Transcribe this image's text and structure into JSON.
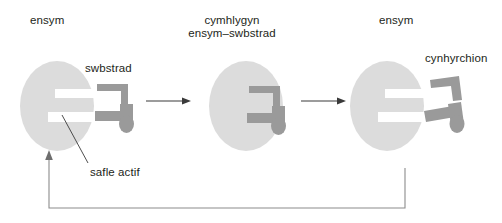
{
  "diagram": {
    "title_language": "Welsh",
    "topic": "enzyme-substrate lock and key mechanism",
    "colors": {
      "enzyme_fill": "#dcdcdc",
      "substrate_fill": "#9a9a9a",
      "product_fill": "#9a9a9a",
      "active_site_fill": "#ffffff",
      "text": "#231f20",
      "arrow": "#3a3a3a",
      "recycle_arrow": "#8c8c8c"
    },
    "labels": {
      "enzyme_left": "ensym",
      "substrate": "swbstrad",
      "complex_line1": "cymhlygyn",
      "complex_line2": "ensym–swbstrad",
      "enzyme_right": "ensym",
      "products": "cynhyrchion",
      "active_site": "safle actif"
    },
    "stages": [
      {
        "name": "stage-1-enzyme-and-substrate",
        "enzyme_label": "ensym",
        "molecule_label": "swbstrad",
        "description": "free enzyme with active site notch and unbound substrate"
      },
      {
        "name": "stage-2-enzyme-substrate-complex",
        "enzyme_label": "cymhlygyn ensym–swbstrad",
        "description": "substrate bound into the enzyme active site"
      },
      {
        "name": "stage-3-enzyme-and-products",
        "enzyme_label": "ensym",
        "molecule_label": "cynhyrchion",
        "description": "substrate split into two products released from enzyme"
      }
    ],
    "arrows": [
      {
        "name": "arrow-stage1-to-stage2",
        "direction": "right"
      },
      {
        "name": "arrow-stage2-to-stage3",
        "direction": "right"
      },
      {
        "name": "recycle-arrow-enzyme-reused",
        "direction": "up-left"
      }
    ],
    "pointer_lines": [
      {
        "name": "active-site-pointer",
        "from_label": "safle actif",
        "to": "active site notch of first enzyme"
      }
    ]
  }
}
